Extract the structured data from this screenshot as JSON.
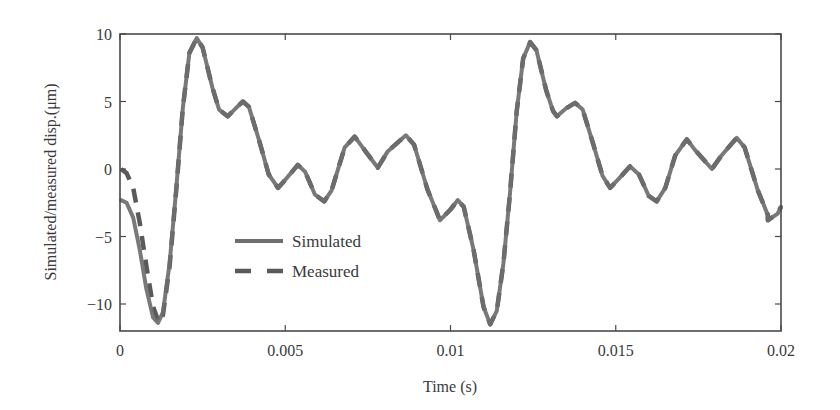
{
  "chart_data": {
    "type": "line",
    "title": "",
    "xlabel": "Time (s)",
    "ylabel": "Simulated/measured disp.(μm)",
    "xlim": [
      0,
      0.02
    ],
    "ylim": [
      -12,
      10
    ],
    "xticks": [
      0,
      0.005,
      0.01,
      0.015,
      0.02
    ],
    "xtick_labels": [
      "0",
      "0.005",
      "0.01",
      "0.015",
      "0.02"
    ],
    "yticks": [
      -10,
      -5,
      0,
      5,
      10
    ],
    "ytick_labels": [
      "−10",
      "−5",
      "0",
      "5",
      "10"
    ],
    "grid": false,
    "legend_position": "lower-left-inside",
    "series": [
      {
        "name": "Simulated",
        "style": "solid",
        "color": "#6e6e6e",
        "points": [
          [
            3e-05,
            -2.3
          ],
          [
            0.0002,
            -2.5
          ],
          [
            0.0004,
            -3.6
          ],
          [
            0.0006,
            -6.0
          ],
          [
            0.0008,
            -8.9
          ],
          [
            0.001,
            -11.0
          ],
          [
            0.00115,
            -11.4
          ],
          [
            0.0013,
            -10.6
          ],
          [
            0.0015,
            -7.0
          ],
          [
            0.0017,
            -1.5
          ],
          [
            0.0019,
            4.5
          ],
          [
            0.0021,
            8.6
          ],
          [
            0.00232,
            9.7
          ],
          [
            0.0025,
            9.0
          ],
          [
            0.0028,
            6.0
          ],
          [
            0.003,
            4.4
          ],
          [
            0.00326,
            3.9
          ],
          [
            0.0035,
            4.5
          ],
          [
            0.00372,
            5.0
          ],
          [
            0.0039,
            4.6
          ],
          [
            0.0042,
            2.2
          ],
          [
            0.0045,
            -0.4
          ],
          [
            0.00478,
            -1.4
          ],
          [
            0.005,
            -0.8
          ],
          [
            0.00538,
            0.3
          ],
          [
            0.0056,
            -0.2
          ],
          [
            0.0059,
            -1.9
          ],
          [
            0.00618,
            -2.4
          ],
          [
            0.0064,
            -1.6
          ],
          [
            0.0068,
            1.6
          ],
          [
            0.0071,
            2.4
          ],
          [
            0.0074,
            1.4
          ],
          [
            0.0078,
            0.1
          ],
          [
            0.0081,
            1.3
          ],
          [
            0.00865,
            2.5
          ],
          [
            0.0089,
            1.8
          ],
          [
            0.0093,
            -1.5
          ],
          [
            0.0096,
            -3.3
          ],
          [
            0.00968,
            -3.8
          ],
          [
            0.01,
            -3.0
          ],
          [
            0.01022,
            -2.3
          ],
          [
            0.0104,
            -2.8
          ],
          [
            0.0107,
            -6.0
          ],
          [
            0.011,
            -10.2
          ],
          [
            0.0112,
            -11.5
          ],
          [
            0.0114,
            -10.5
          ],
          [
            0.0116,
            -7.0
          ],
          [
            0.0118,
            -1.8
          ],
          [
            0.012,
            4.2
          ],
          [
            0.0122,
            8.2
          ],
          [
            0.01241,
            9.4
          ],
          [
            0.0126,
            8.8
          ],
          [
            0.0129,
            5.8
          ],
          [
            0.0131,
            4.3
          ],
          [
            0.01322,
            3.9
          ],
          [
            0.0135,
            4.5
          ],
          [
            0.01377,
            4.9
          ],
          [
            0.014,
            4.4
          ],
          [
            0.0143,
            2.0
          ],
          [
            0.0146,
            -0.5
          ],
          [
            0.01483,
            -1.4
          ],
          [
            0.0151,
            -0.7
          ],
          [
            0.01543,
            0.2
          ],
          [
            0.0157,
            -0.4
          ],
          [
            0.016,
            -2.0
          ],
          [
            0.01624,
            -2.4
          ],
          [
            0.0165,
            -1.4
          ],
          [
            0.0168,
            1.0
          ],
          [
            0.01715,
            2.2
          ],
          [
            0.0174,
            1.4
          ],
          [
            0.01791,
            0.0
          ],
          [
            0.0182,
            1.0
          ],
          [
            0.01866,
            2.3
          ],
          [
            0.0189,
            1.6
          ],
          [
            0.0193,
            -1.6
          ],
          [
            0.0196,
            -3.4
          ],
          [
            0.0196,
            -3.8
          ],
          [
            0.0199,
            -3.3
          ],
          [
            0.02,
            -2.8
          ]
        ]
      },
      {
        "name": "Measured",
        "style": "dashed",
        "color": "#5a5a5a",
        "points": [
          [
            3e-05,
            0.0
          ],
          [
            0.0002,
            -0.3
          ],
          [
            0.0004,
            -1.4
          ],
          [
            0.0006,
            -4.0
          ],
          [
            0.0008,
            -7.2
          ],
          [
            0.001,
            -10.2
          ],
          [
            0.00118,
            -11.4
          ],
          [
            0.0013,
            -10.8
          ],
          [
            0.0015,
            -7.2
          ],
          [
            0.0017,
            -1.6
          ],
          [
            0.0019,
            4.5
          ],
          [
            0.0021,
            8.6
          ],
          [
            0.00232,
            9.7
          ],
          [
            0.0025,
            9.0
          ],
          [
            0.0028,
            6.0
          ],
          [
            0.003,
            4.4
          ],
          [
            0.00326,
            3.9
          ],
          [
            0.0035,
            4.5
          ],
          [
            0.00372,
            5.0
          ],
          [
            0.0039,
            4.6
          ],
          [
            0.0042,
            2.2
          ],
          [
            0.0045,
            -0.4
          ],
          [
            0.00478,
            -1.4
          ],
          [
            0.005,
            -0.8
          ],
          [
            0.00538,
            0.3
          ],
          [
            0.0056,
            -0.2
          ],
          [
            0.0059,
            -1.9
          ],
          [
            0.00618,
            -2.4
          ],
          [
            0.0064,
            -1.6
          ],
          [
            0.0068,
            1.6
          ],
          [
            0.0071,
            2.4
          ],
          [
            0.0074,
            1.4
          ],
          [
            0.0078,
            0.1
          ],
          [
            0.0081,
            1.3
          ],
          [
            0.00865,
            2.5
          ],
          [
            0.0089,
            1.8
          ],
          [
            0.0093,
            -1.5
          ],
          [
            0.0096,
            -3.3
          ],
          [
            0.00968,
            -3.8
          ],
          [
            0.01,
            -3.0
          ],
          [
            0.01022,
            -2.3
          ],
          [
            0.0104,
            -2.8
          ],
          [
            0.0107,
            -6.0
          ],
          [
            0.011,
            -10.2
          ],
          [
            0.0112,
            -11.5
          ],
          [
            0.0114,
            -10.5
          ],
          [
            0.0116,
            -7.0
          ],
          [
            0.0118,
            -1.8
          ],
          [
            0.012,
            4.2
          ],
          [
            0.0122,
            8.2
          ],
          [
            0.01241,
            9.4
          ],
          [
            0.0126,
            8.8
          ],
          [
            0.0129,
            5.8
          ],
          [
            0.0131,
            4.3
          ],
          [
            0.01322,
            3.9
          ],
          [
            0.0135,
            4.5
          ],
          [
            0.01377,
            4.9
          ],
          [
            0.014,
            4.4
          ],
          [
            0.0143,
            2.0
          ],
          [
            0.0146,
            -0.5
          ],
          [
            0.01483,
            -1.4
          ],
          [
            0.0151,
            -0.7
          ],
          [
            0.01543,
            0.2
          ],
          [
            0.0157,
            -0.4
          ],
          [
            0.016,
            -2.0
          ],
          [
            0.01624,
            -2.4
          ],
          [
            0.0165,
            -1.4
          ],
          [
            0.0168,
            1.0
          ],
          [
            0.01715,
            2.2
          ],
          [
            0.0174,
            1.4
          ],
          [
            0.01791,
            0.0
          ],
          [
            0.0182,
            1.0
          ],
          [
            0.01866,
            2.3
          ],
          [
            0.0189,
            1.6
          ],
          [
            0.0193,
            -1.6
          ],
          [
            0.0196,
            -3.4
          ],
          [
            0.0196,
            -3.8
          ],
          [
            0.0199,
            -3.3
          ],
          [
            0.02,
            -2.8
          ]
        ]
      }
    ],
    "legend": [
      {
        "label": "Simulated",
        "style": "solid"
      },
      {
        "label": "Measured",
        "style": "dashed"
      }
    ]
  },
  "layout": {
    "plot_box": {
      "left": 120,
      "top": 34,
      "right": 781,
      "bottom": 331
    },
    "axis_color": "#4a4a4a"
  }
}
